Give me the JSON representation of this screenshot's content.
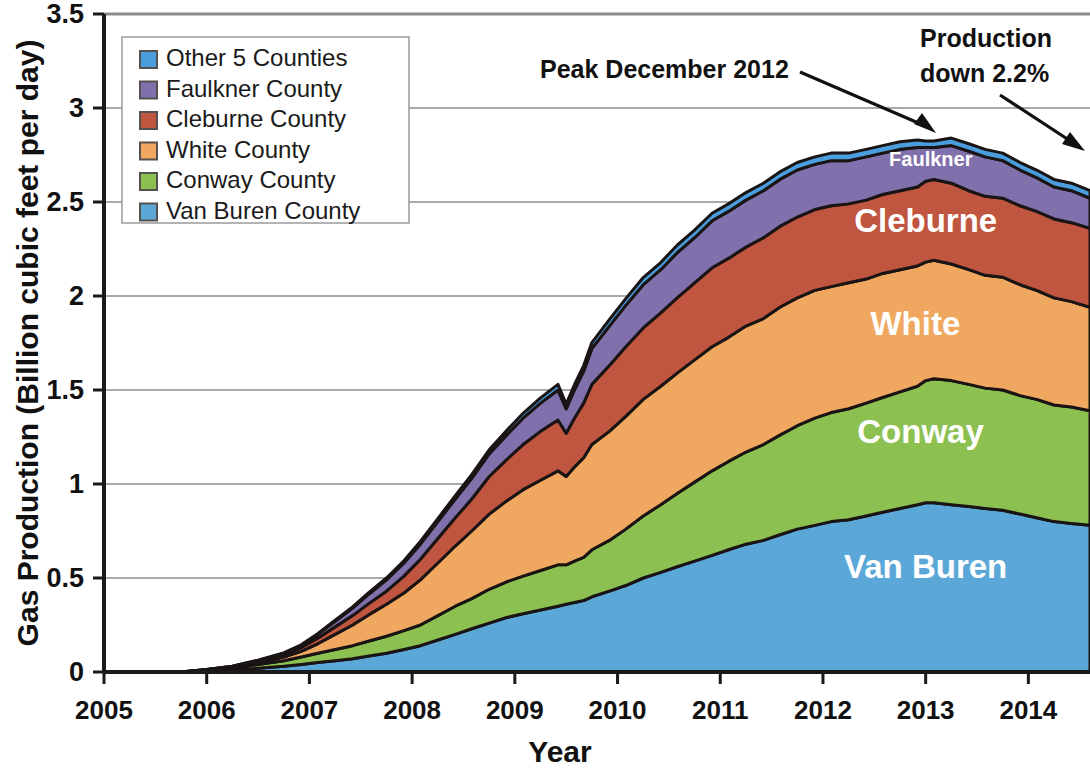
{
  "chart_data": {
    "type": "area",
    "stacked": true,
    "title": "",
    "xlabel": "Year",
    "ylabel": "Gas Production (Billion cubic feet per day)",
    "xlim": [
      2005,
      2014.6
    ],
    "ylim": [
      0,
      3.5
    ],
    "ytick_labels": [
      "0",
      "0.5",
      "1",
      "1.5",
      "2",
      "2.5",
      "3",
      "3.5"
    ],
    "ytick_values": [
      0,
      0.5,
      1,
      1.5,
      2,
      2.5,
      3,
      3.5
    ],
    "xtick_labels": [
      "2005",
      "2006",
      "2007",
      "2008",
      "2009",
      "2010",
      "2011",
      "2012",
      "2013",
      "2014"
    ],
    "xtick_values": [
      2005,
      2006,
      2007,
      2008,
      2009,
      2010,
      2011,
      2012,
      2013,
      2014
    ],
    "grid": "horizontal",
    "legend_position": "top-left-inside",
    "legend_order_top_down": [
      "Other 5 Counties",
      "Faulkner County",
      "Cleburne County",
      "White County",
      "Conway County",
      "Van Buren County"
    ],
    "x": [
      2005.0,
      2005.25,
      2005.5,
      2005.75,
      2006.0,
      2006.25,
      2006.5,
      2006.75,
      2006.92,
      2007.08,
      2007.25,
      2007.42,
      2007.58,
      2007.75,
      2007.92,
      2008.08,
      2008.25,
      2008.42,
      2008.58,
      2008.75,
      2008.92,
      2009.08,
      2009.25,
      2009.42,
      2009.5,
      2009.58,
      2009.67,
      2009.75,
      2009.92,
      2010.08,
      2010.25,
      2010.42,
      2010.58,
      2010.75,
      2010.92,
      2011.08,
      2011.25,
      2011.42,
      2011.58,
      2011.75,
      2011.92,
      2012.08,
      2012.25,
      2012.42,
      2012.58,
      2012.75,
      2012.92,
      2013.0,
      2013.08,
      2013.25,
      2013.42,
      2013.58,
      2013.75,
      2013.92,
      2014.08,
      2014.25,
      2014.42,
      2014.6
    ],
    "series": [
      {
        "name": "Van Buren County",
        "color": "#5ba8d8",
        "values": [
          0.0,
          0.0,
          0.0,
          0.0,
          0.005,
          0.01,
          0.02,
          0.03,
          0.04,
          0.05,
          0.06,
          0.07,
          0.085,
          0.1,
          0.12,
          0.14,
          0.17,
          0.2,
          0.23,
          0.26,
          0.29,
          0.31,
          0.33,
          0.35,
          0.36,
          0.37,
          0.38,
          0.4,
          0.43,
          0.46,
          0.5,
          0.53,
          0.56,
          0.59,
          0.62,
          0.65,
          0.68,
          0.7,
          0.73,
          0.76,
          0.78,
          0.8,
          0.81,
          0.83,
          0.85,
          0.87,
          0.89,
          0.9,
          0.9,
          0.89,
          0.88,
          0.87,
          0.86,
          0.84,
          0.82,
          0.8,
          0.79,
          0.78
        ]
      },
      {
        "name": "Conway County",
        "color": "#8cc152",
        "values": [
          0.0,
          0.0,
          0.0,
          0.0,
          0.005,
          0.01,
          0.02,
          0.03,
          0.04,
          0.05,
          0.06,
          0.07,
          0.08,
          0.09,
          0.1,
          0.11,
          0.13,
          0.15,
          0.16,
          0.18,
          0.19,
          0.2,
          0.21,
          0.22,
          0.21,
          0.22,
          0.23,
          0.25,
          0.27,
          0.3,
          0.33,
          0.36,
          0.39,
          0.42,
          0.45,
          0.47,
          0.49,
          0.51,
          0.53,
          0.55,
          0.57,
          0.58,
          0.59,
          0.6,
          0.61,
          0.62,
          0.63,
          0.65,
          0.66,
          0.66,
          0.65,
          0.64,
          0.64,
          0.63,
          0.63,
          0.62,
          0.62,
          0.61
        ]
      },
      {
        "name": "White County",
        "color": "#f0a860",
        "values": [
          0.0,
          0.0,
          0.0,
          0.0,
          0.002,
          0.005,
          0.01,
          0.02,
          0.03,
          0.05,
          0.08,
          0.11,
          0.14,
          0.17,
          0.2,
          0.24,
          0.28,
          0.32,
          0.36,
          0.4,
          0.43,
          0.46,
          0.48,
          0.5,
          0.47,
          0.5,
          0.53,
          0.56,
          0.58,
          0.6,
          0.62,
          0.63,
          0.64,
          0.65,
          0.66,
          0.66,
          0.67,
          0.67,
          0.68,
          0.68,
          0.68,
          0.67,
          0.67,
          0.66,
          0.66,
          0.65,
          0.64,
          0.63,
          0.63,
          0.62,
          0.61,
          0.6,
          0.6,
          0.59,
          0.58,
          0.57,
          0.56,
          0.55
        ]
      },
      {
        "name": "Cleburne County",
        "color": "#c0563f",
        "values": [
          0.0,
          0.0,
          0.0,
          0.0,
          0.002,
          0.004,
          0.008,
          0.012,
          0.02,
          0.03,
          0.04,
          0.05,
          0.06,
          0.07,
          0.09,
          0.11,
          0.13,
          0.15,
          0.17,
          0.2,
          0.22,
          0.24,
          0.26,
          0.27,
          0.23,
          0.26,
          0.29,
          0.32,
          0.35,
          0.37,
          0.38,
          0.39,
          0.4,
          0.41,
          0.42,
          0.42,
          0.42,
          0.43,
          0.43,
          0.43,
          0.43,
          0.43,
          0.42,
          0.42,
          0.42,
          0.42,
          0.42,
          0.43,
          0.43,
          0.43,
          0.42,
          0.42,
          0.42,
          0.42,
          0.42,
          0.42,
          0.42,
          0.42
        ]
      },
      {
        "name": "Faulkner County",
        "color": "#8070ac",
        "values": [
          0.0,
          0.0,
          0.0,
          0.0,
          0.0,
          0.002,
          0.004,
          0.008,
          0.012,
          0.02,
          0.03,
          0.04,
          0.05,
          0.06,
          0.07,
          0.08,
          0.09,
          0.1,
          0.11,
          0.12,
          0.13,
          0.14,
          0.15,
          0.16,
          0.13,
          0.15,
          0.17,
          0.19,
          0.21,
          0.22,
          0.23,
          0.23,
          0.24,
          0.24,
          0.25,
          0.25,
          0.25,
          0.25,
          0.25,
          0.25,
          0.24,
          0.24,
          0.23,
          0.23,
          0.22,
          0.22,
          0.21,
          0.18,
          0.17,
          0.2,
          0.21,
          0.21,
          0.2,
          0.19,
          0.18,
          0.17,
          0.17,
          0.16
        ]
      },
      {
        "name": "Other 5 Counties",
        "color": "#4a9ede",
        "values": [
          0.0,
          0.0,
          0.0,
          0.0,
          0.0,
          0.0,
          0.001,
          0.002,
          0.003,
          0.004,
          0.005,
          0.006,
          0.008,
          0.01,
          0.012,
          0.014,
          0.016,
          0.018,
          0.02,
          0.022,
          0.024,
          0.026,
          0.028,
          0.03,
          0.025,
          0.028,
          0.03,
          0.032,
          0.034,
          0.036,
          0.038,
          0.038,
          0.04,
          0.04,
          0.04,
          0.04,
          0.04,
          0.04,
          0.04,
          0.04,
          0.04,
          0.04,
          0.04,
          0.04,
          0.04,
          0.04,
          0.04,
          0.035,
          0.035,
          0.04,
          0.04,
          0.04,
          0.04,
          0.04,
          0.04,
          0.04,
          0.04,
          0.04
        ]
      }
    ],
    "annotations": [
      {
        "id": "peak",
        "text_line1": "Peak  December 2012",
        "text_line2": "",
        "points_to_x": 2012.95,
        "points_to_y": 2.9
      },
      {
        "id": "decline",
        "text_line1": "Production",
        "text_line2": "down 2.2%",
        "points_to_x": 2014.5,
        "points_to_y": 2.85
      }
    ],
    "area_labels": [
      {
        "name": "Faulkner",
        "x": 2013.05,
        "y": 2.69
      },
      {
        "name": "Cleburne",
        "x": 2013.0,
        "y": 2.34
      },
      {
        "name": "White",
        "x": 2012.9,
        "y": 1.79
      },
      {
        "name": "Conway",
        "x": 2012.95,
        "y": 1.22
      },
      {
        "name": "Van Buren",
        "x": 2013.0,
        "y": 0.5
      }
    ]
  },
  "axes": {
    "y_title": "Gas Production (Billion cubic feet per day)",
    "x_title": "Year",
    "y_ticks": [
      "3.5",
      "3",
      "2.5",
      "2",
      "1.5",
      "1",
      "0.5",
      "0"
    ],
    "x_ticks": [
      "2005",
      "2006",
      "2007",
      "2008",
      "2009",
      "2010",
      "2011",
      "2012",
      "2013",
      "2014"
    ]
  },
  "legend": {
    "items": [
      {
        "label": "Other 5 Counties",
        "color": "#4a9ede"
      },
      {
        "label": "Faulkner County",
        "color": "#8070ac"
      },
      {
        "label": "Cleburne County",
        "color": "#c0563f"
      },
      {
        "label": "White County",
        "color": "#f0a860"
      },
      {
        "label": "Conway County",
        "color": "#8cc152"
      },
      {
        "label": "Van Buren County",
        "color": "#5ba8d8"
      }
    ]
  },
  "annotations": {
    "peak_label": "Peak  December 2012",
    "decline_label_line1": "Production",
    "decline_label_line2": "down 2.2%"
  },
  "area_labels": {
    "faulkner": "Faulkner",
    "cleburne": "Cleburne",
    "white": "White",
    "conway": "Conway",
    "van_buren": "Van Buren"
  },
  "colors": {
    "other5": "#4a9ede",
    "faulkner": "#8070ac",
    "cleburne": "#c0563f",
    "white": "#f0a860",
    "conway": "#8cc152",
    "van_buren": "#5ba8d8",
    "axis": "#1a1a1a",
    "grid": "#8c8c8c",
    "outline": "#1a1414"
  }
}
